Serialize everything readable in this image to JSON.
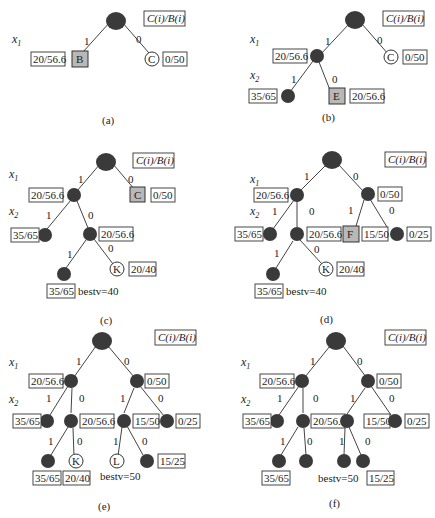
{
  "legend_label": "C(i)/B(i)",
  "var_labels": {
    "x1": "x1",
    "x2": "x2"
  },
  "panels": [
    {
      "id": "a",
      "caption": "(a)",
      "edges": [
        {
          "from": "root",
          "to": "B",
          "label": "1"
        },
        {
          "from": "root",
          "to": "C",
          "label": "0"
        }
      ],
      "nodes": [
        {
          "id": "root",
          "type": "expanded"
        },
        {
          "id": "B",
          "type": "current",
          "letter": "B",
          "value": "20/56.6"
        },
        {
          "id": "C",
          "type": "live",
          "letter": "C",
          "value": "0/50"
        }
      ]
    },
    {
      "id": "b",
      "caption": "(b)",
      "edges": [
        {
          "from": "root",
          "to": "n1",
          "label": "1"
        },
        {
          "from": "root",
          "to": "C",
          "label": "0"
        },
        {
          "from": "n1",
          "to": "n11",
          "label": "1"
        },
        {
          "from": "n1",
          "to": "E",
          "label": "0"
        }
      ],
      "nodes": [
        {
          "id": "root",
          "type": "expanded"
        },
        {
          "id": "n1",
          "type": "expanded",
          "value": "20/56.6"
        },
        {
          "id": "C",
          "type": "live",
          "letter": "C",
          "value": "0/50"
        },
        {
          "id": "n11",
          "type": "expanded",
          "value": "35/65"
        },
        {
          "id": "E",
          "type": "current",
          "letter": "E",
          "value": "20/56.6"
        }
      ]
    },
    {
      "id": "c",
      "caption": "(c)",
      "best_v": "bestv=40",
      "edges": [
        {
          "from": "root",
          "to": "n1",
          "label": "1"
        },
        {
          "from": "root",
          "to": "C",
          "label": "0"
        },
        {
          "from": "n1",
          "to": "n11",
          "label": "1"
        },
        {
          "from": "n1",
          "to": "n10",
          "label": "0"
        },
        {
          "from": "n10",
          "to": "n101",
          "label": "1"
        },
        {
          "from": "n10",
          "to": "K",
          "label": "0"
        }
      ],
      "nodes": [
        {
          "id": "root",
          "type": "expanded"
        },
        {
          "id": "n1",
          "type": "expanded",
          "value": "20/56.6"
        },
        {
          "id": "C",
          "type": "current",
          "letter": "C",
          "value": "0/50"
        },
        {
          "id": "n11",
          "type": "expanded",
          "value": "35/65"
        },
        {
          "id": "n10",
          "type": "expanded",
          "value": "20/56.6"
        },
        {
          "id": "n101",
          "type": "expanded",
          "value": "35/65"
        },
        {
          "id": "K",
          "type": "live",
          "letter": "K",
          "value": "20/40"
        }
      ]
    },
    {
      "id": "d",
      "caption": "(d)",
      "best_v": "bestv=40",
      "edges": [
        {
          "from": "root",
          "to": "n1",
          "label": "1"
        },
        {
          "from": "root",
          "to": "n0",
          "label": "0"
        },
        {
          "from": "n1",
          "to": "n11",
          "label": "1"
        },
        {
          "from": "n1",
          "to": "n10",
          "label": "0"
        },
        {
          "from": "n0",
          "to": "F",
          "label": "1"
        },
        {
          "from": "n0",
          "to": "n00",
          "label": "0"
        },
        {
          "from": "n10",
          "to": "n101",
          "label": "1"
        },
        {
          "from": "n10",
          "to": "K",
          "label": "0"
        }
      ],
      "nodes": [
        {
          "id": "root",
          "type": "expanded"
        },
        {
          "id": "n1",
          "type": "expanded",
          "value": "20/56.6"
        },
        {
          "id": "n0",
          "type": "expanded",
          "value": "0/50"
        },
        {
          "id": "n11",
          "type": "expanded",
          "value": "35/65"
        },
        {
          "id": "n10",
          "type": "expanded",
          "value": "20/56.6"
        },
        {
          "id": "F",
          "type": "current",
          "letter": "F",
          "value": "15/50"
        },
        {
          "id": "n00",
          "type": "expanded",
          "value": "0/25"
        },
        {
          "id": "n101",
          "type": "expanded",
          "value": "35/65"
        },
        {
          "id": "K",
          "type": "live",
          "letter": "K",
          "value": "20/40"
        }
      ]
    },
    {
      "id": "e",
      "caption": "(e)",
      "best_v": "bestv=50",
      "edges": [
        {
          "from": "root",
          "to": "n1",
          "label": "1"
        },
        {
          "from": "root",
          "to": "n0",
          "label": "0"
        },
        {
          "from": "n1",
          "to": "n11",
          "label": "1"
        },
        {
          "from": "n1",
          "to": "n10",
          "label": "0"
        },
        {
          "from": "n0",
          "to": "n01",
          "label": "1"
        },
        {
          "from": "n0",
          "to": "n00",
          "label": "0"
        },
        {
          "from": "n10",
          "to": "n101",
          "label": "1"
        },
        {
          "from": "n10",
          "to": "K",
          "label": "0"
        },
        {
          "from": "n01",
          "to": "L",
          "label": "1"
        },
        {
          "from": "n01",
          "to": "n010",
          "label": "0"
        }
      ],
      "nodes": [
        {
          "id": "root",
          "type": "expanded"
        },
        {
          "id": "n1",
          "type": "expanded",
          "value": "20/56.6"
        },
        {
          "id": "n0",
          "type": "expanded",
          "value": "0/50"
        },
        {
          "id": "n11",
          "type": "expanded",
          "value": "35/65"
        },
        {
          "id": "n10",
          "type": "expanded",
          "value": "20/56.6"
        },
        {
          "id": "n01",
          "type": "expanded",
          "value": "15/50"
        },
        {
          "id": "n00",
          "type": "expanded",
          "value": "0/25"
        },
        {
          "id": "n101",
          "type": "expanded",
          "value": "35/65"
        },
        {
          "id": "K",
          "type": "live",
          "letter": "K",
          "value": "20/40"
        },
        {
          "id": "L",
          "type": "live",
          "letter": "L"
        },
        {
          "id": "n010",
          "type": "expanded",
          "value": "15/25"
        }
      ]
    },
    {
      "id": "f",
      "caption": "(f)",
      "best_v": "bestv=50",
      "edges": [
        {
          "from": "root",
          "to": "n1",
          "label": "1"
        },
        {
          "from": "root",
          "to": "n0",
          "label": "0"
        },
        {
          "from": "n1",
          "to": "n11",
          "label": "1"
        },
        {
          "from": "n1",
          "to": "n10",
          "label": "0"
        },
        {
          "from": "n0",
          "to": "n01",
          "label": "1"
        },
        {
          "from": "n0",
          "to": "n00",
          "label": "0"
        },
        {
          "from": "n10",
          "to": "n101",
          "label": "1"
        },
        {
          "from": "n10",
          "to": "n100",
          "label": "0"
        },
        {
          "from": "n01",
          "to": "n011",
          "label": "1"
        },
        {
          "from": "n01",
          "to": "n010",
          "label": "0"
        }
      ],
      "nodes": [
        {
          "id": "root",
          "type": "expanded"
        },
        {
          "id": "n1",
          "type": "expanded",
          "value": "20/56.6"
        },
        {
          "id": "n0",
          "type": "expanded",
          "value": "0/50"
        },
        {
          "id": "n11",
          "type": "expanded",
          "value": "35/65"
        },
        {
          "id": "n10",
          "type": "expanded",
          "value": "20/56.6"
        },
        {
          "id": "n01",
          "type": "expanded",
          "value": "15/50"
        },
        {
          "id": "n00",
          "type": "expanded",
          "value": "0/25"
        },
        {
          "id": "n101",
          "type": "expanded",
          "value": "35/65"
        },
        {
          "id": "n100",
          "type": "expanded"
        },
        {
          "id": "n011",
          "type": "expanded"
        },
        {
          "id": "n010",
          "type": "expanded",
          "value": "15/25"
        }
      ]
    }
  ]
}
